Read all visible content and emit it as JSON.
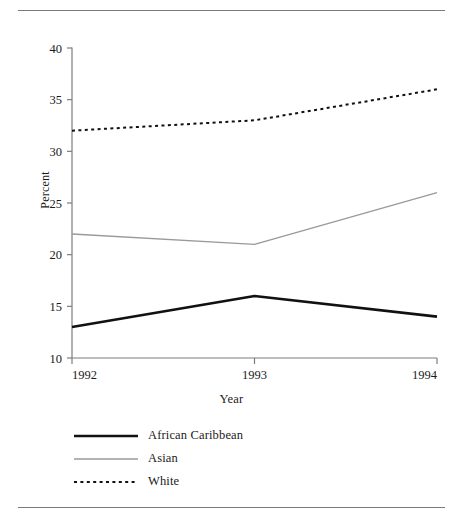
{
  "figure": {
    "rule_color": "#7a7a7a"
  },
  "chart_data": {
    "type": "line",
    "title": "",
    "xlabel": "Year",
    "ylabel": "Percent",
    "categories": [
      "1992",
      "1993",
      "1994"
    ],
    "x": [
      1992,
      1993,
      1994
    ],
    "xlim": [
      1992,
      1994
    ],
    "ylim": [
      10,
      40
    ],
    "yticks": [
      10,
      15,
      20,
      25,
      30,
      35,
      40
    ],
    "ytick_labels": [
      "10",
      "15",
      "20",
      "25",
      "30",
      "35",
      "40"
    ],
    "xticks": [
      1992,
      1993,
      1994
    ],
    "xtick_labels": [
      "1992",
      "1993",
      "1994"
    ],
    "grid": false,
    "legend_position": "below",
    "series": [
      {
        "name": "African Caribbean",
        "values": [
          13,
          16,
          14
        ],
        "color": "#111111",
        "style": "solid",
        "width": 2.6
      },
      {
        "name": "Asian",
        "values": [
          22,
          21,
          26
        ],
        "color": "#9a9a9a",
        "style": "solid",
        "width": 1.4
      },
      {
        "name": "White",
        "values": [
          32,
          33,
          36
        ],
        "color": "#111111",
        "style": "dotted",
        "width": 2.0
      }
    ]
  },
  "legend": {
    "items": [
      {
        "label": "African Caribbean"
      },
      {
        "label": "Asian"
      },
      {
        "label": "White"
      }
    ]
  },
  "axes": {
    "y_title": "Percent",
    "x_title": "Year"
  }
}
